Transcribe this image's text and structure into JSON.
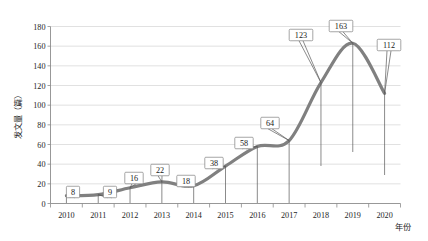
{
  "chart_data": {
    "type": "line",
    "title": "",
    "xlabel": "年份",
    "ylabel": "发文量（篇）",
    "categories": [
      "2010",
      "2011",
      "2012",
      "2013",
      "2014",
      "2015",
      "2016",
      "2017",
      "2018",
      "2019",
      "2020"
    ],
    "values": [
      8,
      9,
      16,
      22,
      18,
      38,
      58,
      64,
      123,
      163,
      112
    ],
    "series": [
      {
        "name": "发文量",
        "values": [
          8,
          9,
          16,
          22,
          18,
          38,
          58,
          64,
          123,
          163,
          112
        ]
      }
    ],
    "data_labels": [
      "8",
      "9",
      "16",
      "22",
      "18",
      "38",
      "58",
      "64",
      "123",
      "163",
      "112"
    ],
    "ylim": [
      0,
      180
    ],
    "ytick_values": [
      0,
      20,
      40,
      60,
      80,
      100,
      120,
      140,
      160,
      180
    ],
    "ytick_labels": [
      "0",
      "20",
      "40",
      "60",
      "80",
      "100",
      "120",
      "140",
      "160",
      "180"
    ],
    "grid": true,
    "legend": false,
    "legend_position": "none",
    "smooth": true,
    "line_color": "#808080",
    "gridline_color": "#d4d4d4",
    "axis_color": "#8c8c8c",
    "background_color": "#ffffff"
  }
}
